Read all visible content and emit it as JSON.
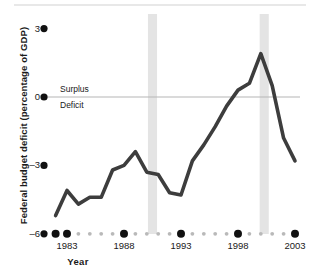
{
  "chart_data": {
    "type": "line",
    "title": "",
    "xlabel": "Year",
    "ylabel": "Federal budget deficit (percentage of GDP)",
    "xlim": [
      1982,
      2003
    ],
    "ylim": [
      -6,
      3
    ],
    "grid": false,
    "legend_position": "none",
    "zero_line": true,
    "y_ticks": [
      3,
      0,
      -3,
      -6
    ],
    "y_tick_labels": [
      "3",
      "0",
      "–3",
      "–6"
    ],
    "x_ticks": [
      1983,
      1988,
      1993,
      1998,
      2003
    ],
    "x_tick_labels": [
      "1983",
      "1988",
      "1993",
      "1998",
      "2003"
    ],
    "annotations": [
      {
        "text": "Surplus",
        "x": 1983.4,
        "y": 0.55
      },
      {
        "text": "Deficit",
        "x": 1983.4,
        "y": -0.75
      }
    ],
    "shaded_bands": [
      {
        "label": "recession-band-1990",
        "x0": 1990.1,
        "x1": 1990.9
      },
      {
        "label": "recession-band-2001",
        "x0": 1999.9,
        "x1": 2000.7
      }
    ],
    "series": [
      {
        "name": "Federal budget deficit (percentage of GDP)",
        "color": "#3d3d3d",
        "x": [
          1982,
          1983,
          1984,
          1985,
          1986,
          1987,
          1988,
          1989,
          1990,
          1991,
          1992,
          1993,
          1994,
          1995,
          1996,
          1997,
          1998,
          1999,
          2000,
          2001,
          2002,
          2003
        ],
        "values": [
          -5.2,
          -4.1,
          -4.7,
          -4.4,
          -4.4,
          -3.2,
          -3.0,
          -2.4,
          -3.3,
          -3.4,
          -4.2,
          -4.3,
          -2.8,
          -2.1,
          -1.3,
          -0.4,
          0.3,
          0.6,
          1.9,
          0.5,
          -1.8,
          -2.8
        ]
      }
    ]
  },
  "axis": {
    "y_title": "Federal budget deficit (percentage of GDP)",
    "x_title": "Year",
    "y_labels": {
      "t3": "3",
      "t0": "0",
      "tm3": "–3",
      "tm6": "–6"
    },
    "x_labels": {
      "y1983": "1983",
      "y1988": "1988",
      "y1993": "1993",
      "y1998": "1998",
      "y2003": "2003"
    }
  },
  "labels": {
    "surplus": "Surplus",
    "deficit": "Deficit"
  },
  "colors": {
    "line": "#3d3d3d",
    "band": "#e4e4e4",
    "zero_line": "#b6b6b6",
    "tick_dot_major": "#111111",
    "tick_dot_minor": "#b9b9b9",
    "top_rule": "#e8e8e8",
    "text": "#1a1a1a"
  }
}
